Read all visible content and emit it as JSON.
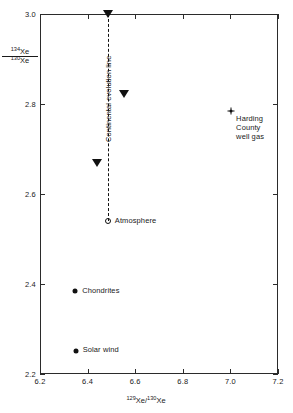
{
  "chart_data": {
    "type": "scatter",
    "title": "",
    "xlabel": "129Xe/130Xe",
    "ylabel": "134Xe/130Xe",
    "xlim": [
      6.2,
      7.2
    ],
    "ylim": [
      2.2,
      3.0
    ],
    "grid": false,
    "legend": "none",
    "xticks": [
      "6.2",
      "6.4",
      "6.6",
      "6.8",
      "7.0",
      "7.2"
    ],
    "xtick_values": [
      6.2,
      6.4,
      6.6,
      6.8,
      7.0,
      7.2
    ],
    "yticks": [
      "2.2",
      "2.4",
      "2.6",
      "2.8",
      "3.0"
    ],
    "ytick_values": [
      2.2,
      2.4,
      2.6,
      2.8,
      3.0
    ],
    "series": [
      {
        "name": "Continental samples",
        "marker": "triangle-down-filled",
        "points": [
          {
            "x": 6.485,
            "y": 3.0
          },
          {
            "x": 6.552,
            "y": 2.822
          },
          {
            "x": 6.438,
            "y": 2.668
          }
        ]
      },
      {
        "name": "Atmosphere",
        "marker": "open-circle",
        "label": "Atmosphere",
        "points": [
          {
            "x": 6.485,
            "y": 2.541
          }
        ]
      },
      {
        "name": "Harding County well gas",
        "marker": "asterisk",
        "label_lines": [
          "Harding",
          "County",
          "well gas"
        ],
        "points": [
          {
            "x": 7.003,
            "y": 2.785
          }
        ]
      },
      {
        "name": "Chondrites",
        "marker": "filled-circle",
        "label": "Chondrites",
        "points": [
          {
            "x": 6.348,
            "y": 2.384
          }
        ]
      },
      {
        "name": "Solar wind",
        "marker": "filled-circle",
        "label": "Solar wind",
        "points": [
          {
            "x": 6.35,
            "y": 2.251
          }
        ]
      }
    ],
    "annotations": [
      {
        "name": "continental-evolution-line",
        "type": "vertical-dashed-line",
        "label": "Continental evolution line",
        "x": 6.485,
        "y_start": 2.541,
        "y_end": 3.0
      }
    ]
  },
  "axis": {
    "y_numerator": "134",
    "y_numerator_element": "Xe",
    "y_denominator": "130",
    "y_denominator_element": "Xe",
    "x_numerator": "129",
    "x_element": "Xe",
    "x_separator": "/",
    "x_denominator": "130"
  },
  "labels": {
    "atmosphere": "Atmosphere",
    "harding_line1": "Harding",
    "harding_line2": "County",
    "harding_line3": "well gas",
    "chondrites": "Chondrites",
    "solar_wind": "Solar wind",
    "continental_evolution_line": "Continental evolution line"
  },
  "colors": {
    "marker": "#111111",
    "axis": "#2b2b2b",
    "text": "#1a1a1a",
    "background": "#ffffff"
  }
}
